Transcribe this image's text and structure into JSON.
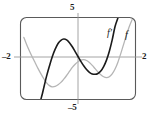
{
  "figure": {
    "kind": "graphing-calculator-screen",
    "background_color": "#ffffff",
    "frame_color": "#5a5a5a",
    "axis_color": "#8f8f8f",
    "curve_f_prime_color": "#1b1b1b",
    "curve_f_color": "#b5b5b5"
  },
  "viewport_labels": {
    "top": "5",
    "bottom": "–5",
    "left": "–2",
    "right": "2"
  },
  "curve_labels": {
    "f_prime": "f′",
    "f": "f"
  },
  "chart_data": {
    "type": "line",
    "title": "",
    "xlabel": "",
    "ylabel": "",
    "xlim": [
      -2,
      2
    ],
    "ylim": [
      -5,
      5
    ],
    "grid": false,
    "legend": "inline-curve-labels",
    "xticks": [
      -2,
      2
    ],
    "yticks": [
      -5,
      5
    ],
    "xticklabels": [
      "–2",
      "2"
    ],
    "yticklabels": [
      "–5",
      "5"
    ],
    "annotations": [
      {
        "text": "f′",
        "x": 1.38,
        "y": 3.05
      },
      {
        "text": "f",
        "x": 1.82,
        "y": 2.85
      }
    ],
    "series": [
      {
        "name": "f′",
        "label": "f′",
        "color": "#1b1b1b",
        "style": "solid",
        "width": 1.6,
        "description": "cubic derivative curve: rises steeply from lower-left, local max near x=-0.7, crosses zero near x=0.15, local min near x=0.65, rises steeply to upper-right",
        "x": [
          -1.3,
          -1.25,
          -1.2,
          -1.15,
          -1.1,
          -1.0,
          -0.9,
          -0.8,
          -0.7,
          -0.6,
          -0.5,
          -0.4,
          -0.3,
          -0.2,
          -0.1,
          0.0,
          0.1,
          0.2,
          0.3,
          0.4,
          0.5,
          0.6,
          0.7,
          0.8,
          0.9,
          1.0,
          1.1,
          1.2,
          1.3,
          1.4
        ],
        "y": [
          -5.0,
          -4.35,
          -3.6,
          -2.85,
          -2.15,
          -0.9,
          0.25,
          1.15,
          1.85,
          2.25,
          2.4,
          2.3,
          1.95,
          1.45,
          0.85,
          0.25,
          -0.35,
          -0.9,
          -1.35,
          -1.7,
          -1.9,
          -1.95,
          -1.85,
          -1.55,
          -1.0,
          -0.2,
          0.9,
          2.3,
          3.95,
          5.0
        ]
      },
      {
        "name": "f",
        "label": "f",
        "color": "#b5b5b5",
        "style": "solid",
        "width": 1.3,
        "description": "quartic antiderivative curve: descends from upper-left, local min near x=-0.9, local max near x=0.2, local min near x=0.95, rises to upper-right",
        "x": [
          -1.9,
          -1.8,
          -1.7,
          -1.6,
          -1.5,
          -1.4,
          -1.3,
          -1.2,
          -1.1,
          -1.0,
          -0.9,
          -0.8,
          -0.7,
          -0.6,
          -0.5,
          -0.4,
          -0.3,
          -0.2,
          -0.1,
          0.0,
          0.1,
          0.2,
          0.3,
          0.4,
          0.5,
          0.6,
          0.7,
          0.8,
          0.9,
          1.0,
          1.1,
          1.2,
          1.3,
          1.4,
          1.5,
          1.6,
          1.7,
          1.8,
          1.9
        ],
        "y": [
          2.6,
          1.7,
          0.9,
          0.15,
          -0.55,
          -1.25,
          -1.9,
          -2.5,
          -3.0,
          -3.35,
          -3.5,
          -3.45,
          -3.25,
          -2.95,
          -2.55,
          -2.1,
          -1.6,
          -1.1,
          -0.7,
          -0.4,
          -0.2,
          -0.15,
          -0.25,
          -0.5,
          -0.85,
          -1.25,
          -1.65,
          -2.0,
          -2.25,
          -2.35,
          -2.25,
          -1.9,
          -1.3,
          -0.45,
          0.6,
          1.75,
          2.9,
          3.95,
          4.8
        ]
      }
    ]
  }
}
